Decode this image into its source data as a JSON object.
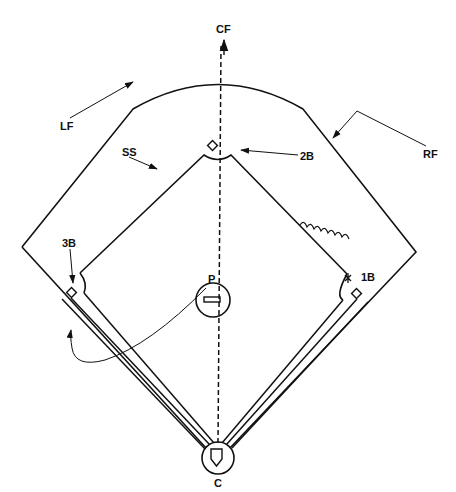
{
  "diagram": {
    "positions": {
      "cf": "CF",
      "lf": "LF",
      "rf": "RF",
      "ss": "SS",
      "second_base": "2B",
      "third_base": "3B",
      "first_base": "1B",
      "pitcher": "P",
      "catcher": "C"
    },
    "colors": {
      "line": "#111111",
      "background": "#ffffff"
    }
  }
}
